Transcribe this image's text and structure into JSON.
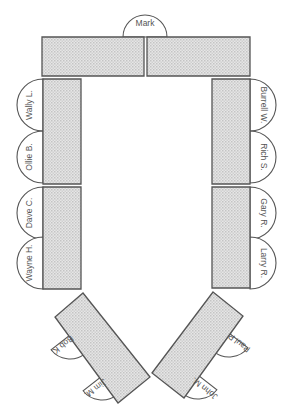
{
  "diagram": {
    "type": "seating-chart",
    "colors": {
      "table_fill": "#dcdcdc",
      "outline": "#555555",
      "text": "#555555",
      "background": "#ffffff"
    },
    "tables": [
      {
        "id": "top-left",
        "points": "42,37 144,37 144,76 42,76"
      },
      {
        "id": "top-right",
        "points": "147,37 250,37 250,76 147,76"
      },
      {
        "id": "left-upper",
        "points": "43,79 81,79 81,184 43,184"
      },
      {
        "id": "left-lower",
        "points": "43,187 81,187 81,289 43,289"
      },
      {
        "id": "right-upper",
        "points": "212,79 250,79 250,184 212,184"
      },
      {
        "id": "right-lower",
        "points": "212,187 250,187 250,288 212,288"
      },
      {
        "id": "bottom-left-angled",
        "points": "83,293 150,377 118,403 55,317"
      },
      {
        "id": "bottom-right-angled",
        "points": "213,292 243,316 184,398 152,373"
      }
    ],
    "seats": [
      {
        "name": "Mark",
        "side": "top",
        "cx": 145,
        "cy": 37,
        "r": 22,
        "rotate": 0,
        "tx": 145,
        "ty": 24
      },
      {
        "name": "Wally L.",
        "side": "left",
        "cx": 43,
        "cy": 105,
        "r": 26,
        "rotate": -90,
        "tx": 30,
        "ty": 105
      },
      {
        "name": "Ollie B.",
        "side": "left",
        "cx": 43,
        "cy": 157,
        "r": 26,
        "rotate": -90,
        "tx": 30,
        "ty": 157
      },
      {
        "name": "Dave C.",
        "side": "left",
        "cx": 43,
        "cy": 213,
        "r": 26,
        "rotate": -90,
        "tx": 30,
        "ty": 213
      },
      {
        "name": "Wayne H.",
        "side": "left",
        "cx": 43,
        "cy": 263,
        "r": 26,
        "rotate": -90,
        "tx": 30,
        "ty": 263
      },
      {
        "name": "Burrell W.",
        "side": "right",
        "cx": 250,
        "cy": 105,
        "r": 26,
        "rotate": 90,
        "tx": 263,
        "ty": 105
      },
      {
        "name": "Rich S.",
        "side": "right",
        "cx": 250,
        "cy": 157,
        "r": 26,
        "rotate": 90,
        "tx": 263,
        "ty": 157
      },
      {
        "name": "Gary R.",
        "side": "right",
        "cx": 250,
        "cy": 213,
        "r": 26,
        "rotate": 90,
        "tx": 263,
        "ty": 213
      },
      {
        "name": "Larry R.",
        "side": "right",
        "cx": 250,
        "cy": 263,
        "r": 26,
        "rotate": 90,
        "tx": 263,
        "ty": 263
      },
      {
        "name": "Bob K.",
        "side": "angled-left",
        "cx": 70,
        "cy": 335,
        "r": 24,
        "rotate": 142,
        "tx": 62,
        "ty": 345
      },
      {
        "name": "Jim M.",
        "side": "angled-left",
        "cx": 102,
        "cy": 376,
        "r": 24,
        "rotate": 142,
        "tx": 95,
        "ty": 388
      },
      {
        "name": "Paul P.",
        "side": "angled-right",
        "cx": 229,
        "cy": 333,
        "r": 24,
        "rotate": -142,
        "tx": 239,
        "ty": 342
      },
      {
        "name": "John M.",
        "side": "angled-right",
        "cx": 198,
        "cy": 375,
        "r": 24,
        "rotate": -142,
        "tx": 205,
        "ty": 388
      }
    ]
  }
}
